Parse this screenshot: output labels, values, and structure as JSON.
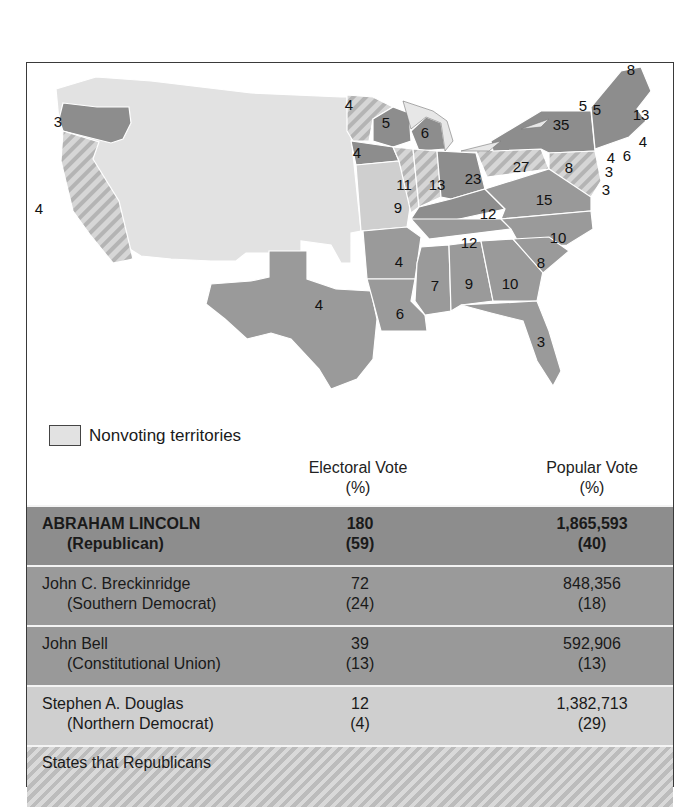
{
  "map": {
    "legend": {
      "label": "Nonvoting territories",
      "swatch_color": "#e2e2e2"
    },
    "colors": {
      "nonvoting": "#e2e2e2",
      "lincoln": "#8d8d8d",
      "breckinridge": "#9a9a9a",
      "bell": "#999999",
      "douglas": "#cfcfcf",
      "hatch_light": "#d9d9d9",
      "hatch_dark": "#b0b0b0"
    },
    "state_labels": [
      {
        "state": "Oregon",
        "votes": "3",
        "x": 57,
        "y": 120
      },
      {
        "state": "California",
        "votes": "4",
        "x": 38,
        "y": 207
      },
      {
        "state": "Minnesota",
        "votes": "4",
        "x": 348,
        "y": 103
      },
      {
        "state": "Wisconsin",
        "votes": "5",
        "x": 385,
        "y": 121
      },
      {
        "state": "Michigan",
        "votes": "6",
        "x": 424,
        "y": 131
      },
      {
        "state": "Iowa",
        "votes": "4",
        "x": 356,
        "y": 151
      },
      {
        "state": "Illinois",
        "votes": "11",
        "x": 403,
        "y": 183
      },
      {
        "state": "Indiana",
        "votes": "13",
        "x": 436,
        "y": 183
      },
      {
        "state": "Ohio",
        "votes": "23",
        "x": 472,
        "y": 177
      },
      {
        "state": "Pennsylvania",
        "votes": "27",
        "x": 520,
        "y": 165
      },
      {
        "state": "New York",
        "votes": "35",
        "x": 560,
        "y": 123
      },
      {
        "state": "Vermont",
        "votes": "5",
        "x": 582,
        "y": 104
      },
      {
        "state": "New Hampshire",
        "votes": "5",
        "x": 596,
        "y": 108
      },
      {
        "state": "Maine",
        "votes": "8",
        "x": 630,
        "y": 68
      },
      {
        "state": "Massachusetts",
        "votes": "13",
        "x": 640,
        "y": 113
      },
      {
        "state": "Rhode Island",
        "votes": "4",
        "x": 642,
        "y": 140
      },
      {
        "state": "Connecticut",
        "votes": "6",
        "x": 626,
        "y": 154
      },
      {
        "state": "New Jersey",
        "votes": "4",
        "x": 610,
        "y": 156
      },
      {
        "state": "Delaware",
        "votes": "3",
        "x": 608,
        "y": 170
      },
      {
        "state": "Maryland",
        "votes": "8",
        "x": 568,
        "y": 166
      },
      {
        "state": "Maryland-small",
        "votes": "3",
        "x": 605,
        "y": 188
      },
      {
        "state": "Missouri",
        "votes": "9",
        "x": 397,
        "y": 206
      },
      {
        "state": "Kentucky",
        "votes": "12",
        "x": 487,
        "y": 212
      },
      {
        "state": "Virginia",
        "votes": "15",
        "x": 543,
        "y": 198
      },
      {
        "state": "Tennessee",
        "votes": "12",
        "x": 468,
        "y": 241
      },
      {
        "state": "North Carolina",
        "votes": "10",
        "x": 557,
        "y": 236
      },
      {
        "state": "Arkansas",
        "votes": "4",
        "x": 398,
        "y": 260
      },
      {
        "state": "South Carolina",
        "votes": "8",
        "x": 540,
        "y": 261
      },
      {
        "state": "Texas",
        "votes": "4",
        "x": 318,
        "y": 303
      },
      {
        "state": "Mississippi",
        "votes": "7",
        "x": 434,
        "y": 284
      },
      {
        "state": "Alabama",
        "votes": "9",
        "x": 468,
        "y": 282
      },
      {
        "state": "Georgia",
        "votes": "10",
        "x": 509,
        "y": 282
      },
      {
        "state": "Louisiana",
        "votes": "6",
        "x": 399,
        "y": 312
      },
      {
        "state": "Florida",
        "votes": "3",
        "x": 540,
        "y": 340
      }
    ]
  },
  "table": {
    "columns": [
      {
        "label": "Electoral Vote",
        "sub": "(%)"
      },
      {
        "label": "Popular Vote",
        "sub": "(%)"
      }
    ],
    "rows": [
      {
        "name": "ABRAHAM LINCOLN",
        "party": "(Republican)",
        "electoral": "180",
        "electoral_pct": "(59)",
        "popular": "1,865,593",
        "popular_pct": "(40)"
      },
      {
        "name": "John C. Breckinridge",
        "party": "(Southern Democrat)",
        "electoral": "72",
        "electoral_pct": "(24)",
        "popular": "848,356",
        "popular_pct": "(18)"
      },
      {
        "name": "John Bell",
        "party": "(Constitutional Union)",
        "electoral": "39",
        "electoral_pct": "(13)",
        "popular": "592,906",
        "popular_pct": "(13)"
      },
      {
        "name": "Stephen A. Douglas",
        "party": "(Northern Democrat)",
        "electoral": "12",
        "electoral_pct": "(4)",
        "popular": "1,382,713",
        "popular_pct": "(29)"
      }
    ],
    "footer_note": "States that Republicans"
  }
}
